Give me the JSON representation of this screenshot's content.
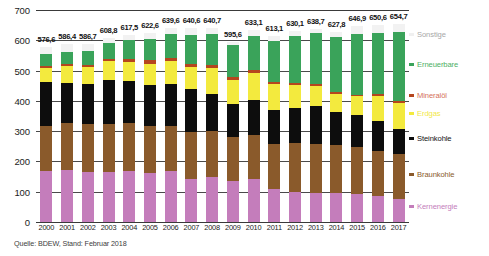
{
  "chart_data": {
    "type": "bar",
    "title": "",
    "subtitle": "",
    "xlabel": "",
    "ylabel": "",
    "stacked": true,
    "grid": true,
    "legend_position": "right",
    "ylim": [
      0,
      700
    ],
    "yticks": [
      "0",
      "100",
      "200",
      "300",
      "400",
      "500",
      "600",
      "700"
    ],
    "ytick_values": [
      0,
      100,
      200,
      300,
      400,
      500,
      600,
      700
    ],
    "categories": [
      "2000",
      "2001",
      "2002",
      "2003",
      "2004",
      "2005",
      "2006",
      "2007",
      "2008",
      "2009",
      "2010",
      "2011",
      "2012",
      "2013",
      "2014",
      "2015",
      "2016",
      "2017"
    ],
    "totals": [
      "576,6",
      "586,4",
      "586,7",
      "608,8",
      "617,5",
      "622,6",
      "639,6",
      "640,6",
      "640,7",
      "595,6",
      "633,1",
      "613,1",
      "630,1",
      "638,7",
      "627,8",
      "646,9",
      "650,6",
      "654,7"
    ],
    "total_values": [
      576.6,
      586.4,
      586.7,
      608.8,
      617.5,
      622.6,
      639.6,
      640.6,
      640.7,
      595.6,
      633.1,
      613.1,
      630.1,
      638.7,
      627.8,
      646.9,
      650.6,
      654.7
    ],
    "series": [
      {
        "name": "Kernenergie",
        "color": "#c47dbb",
        "values": [
          169.6,
          171.3,
          164.8,
          165.1,
          167.1,
          163.0,
          167.4,
          140.5,
          148.8,
          134.9,
          140.6,
          108.0,
          99.5,
          97.3,
          97.1,
          91.8,
          84.6,
          76.3
        ]
      },
      {
        "name": "Braunkohle",
        "color": "#8a5a2b",
        "values": [
          148.3,
          154.8,
          158.0,
          158.2,
          158.4,
          154.1,
          151.1,
          155.1,
          150.6,
          145.6,
          145.9,
          150.1,
          160.7,
          160.9,
          155.8,
          154.5,
          150.0,
          148.4
        ]
      },
      {
        "name": "Steinkohle",
        "color": "#0d0d0d",
        "values": [
          143.1,
          133.6,
          134.1,
          146.4,
          140.8,
          134.1,
          137.9,
          142.0,
          124.6,
          107.9,
          117.0,
          112.4,
          116.4,
          124.0,
          109.0,
          106.5,
          100.1,
          82.6
        ]
      },
      {
        "name": "Erdgas",
        "color": "#f3ea3e",
        "values": [
          49.2,
          55.6,
          56.3,
          61.4,
          62.7,
          71.0,
          74.4,
          75.9,
          86.0,
          80.7,
          89.3,
          86.1,
          76.4,
          67.5,
          61.1,
          62.0,
          81.3,
          86.7
        ]
      },
      {
        "name": "Mineralöl",
        "color": "#b5461e",
        "values": [
          5.9,
          5.6,
          6.0,
          7.1,
          8.9,
          11.6,
          10.3,
          9.7,
          9.2,
          9.6,
          8.7,
          7.2,
          7.6,
          7.2,
          5.7,
          6.2,
          5.8,
          5.6
        ]
      },
      {
        "name": "Erneuerbare",
        "color": "#3aa35a",
        "values": [
          38.0,
          42.0,
          45.0,
          52.0,
          62.0,
          71.0,
          80.0,
          96.0,
          101.0,
          105.0,
          113.0,
          133.0,
          153.0,
          166.0,
          182.0,
          200.0,
          203.0,
          229.0
        ]
      },
      {
        "name": "Sonstige",
        "color": "#f2f2f2",
        "values": [
          22.5,
          23.5,
          22.5,
          18.6,
          17.6,
          17.8,
          18.5,
          21.4,
          20.5,
          11.9,
          18.6,
          16.3,
          16.5,
          15.8,
          17.1,
          25.9,
          25.8,
          26.1
        ]
      }
    ]
  },
  "legend": {
    "items": [
      {
        "label": "Sonstige",
        "color": "#a8a8a8",
        "swatch": "#f0f0f0"
      },
      {
        "label": "Erneuerbare",
        "color": "#4caf63",
        "swatch": "#3aa35a"
      },
      {
        "label": "Mineralöl",
        "color": "#d4705a",
        "swatch": "#b5461e"
      },
      {
        "label": "Erdgas",
        "color": "#f2e84a",
        "swatch": "#f3ea3e"
      },
      {
        "label": "Steinkohle",
        "color": "#111111",
        "swatch": "#0d0d0d"
      },
      {
        "label": "Braunkohle",
        "color": "#8a5a2b",
        "swatch": "#8a5a2b"
      },
      {
        "label": "Kernenergie",
        "color": "#c47dbb",
        "swatch": "#c47dbb"
      }
    ]
  },
  "footer": {
    "source": "Quelle: BDEW, Stand: Februar 2018"
  }
}
